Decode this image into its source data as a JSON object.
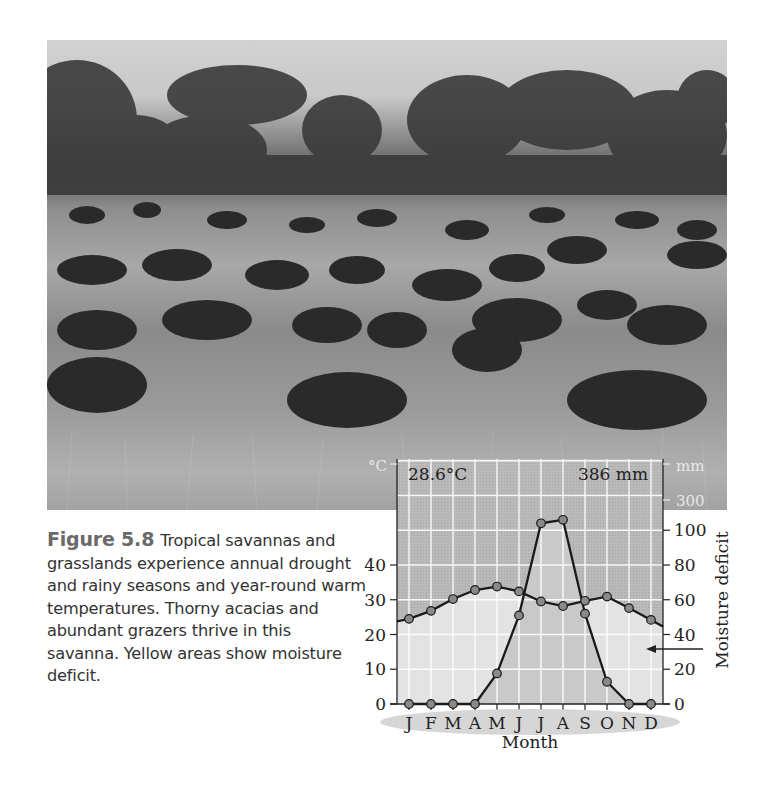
{
  "caption": {
    "figure_label": "Figure 5.8",
    "text": "Tropical savannas and grasslands experience annual drought and rainy seasons and year-round warm temperatures. Thorny acacias and abundant grazers thrive in this savanna. Yellow areas show moisture deficit."
  },
  "photo": {
    "description": "Grayscale photograph of wildebeest herd grazing in tall savanna grass with acacia trees in background"
  },
  "chart_data": {
    "type": "line",
    "title": "",
    "annotations": {
      "mean_temperature": "28.6°C",
      "annual_precipitation": "386 mm",
      "moisture_deficit_label": "Moisture deficit",
      "arrow": "points to moisture deficit (light) area"
    },
    "x": [
      "J",
      "F",
      "M",
      "A",
      "M",
      "J",
      "J",
      "A",
      "S",
      "O",
      "N",
      "D"
    ],
    "xlabel": "Month",
    "y_left": {
      "label": "°C",
      "ticks": [
        0,
        10,
        20,
        30,
        40
      ]
    },
    "y_right": {
      "label": "mm",
      "ticks": [
        0,
        20,
        40,
        60,
        80,
        100,
        300
      ]
    },
    "series": [
      {
        "name": "Temperature (°C)",
        "axis": "left",
        "values": [
          24.5,
          26.8,
          30.2,
          32.8,
          33.8,
          32.4,
          29.5,
          28.2,
          29.7,
          30.9,
          27.6,
          24.2
        ]
      },
      {
        "name": "Precipitation (mm)",
        "axis": "right",
        "values": [
          0,
          0,
          0,
          0,
          17.6,
          51,
          104,
          106,
          52,
          12.8,
          0,
          0
        ]
      }
    ],
    "grid": true,
    "legend": "none"
  },
  "axis_text": {
    "deg_c": "°C",
    "mm": "mm",
    "mm300": "300",
    "temp_label": "28.6°C",
    "precip_label": "386 mm",
    "month": "Month",
    "right_title": "Moisture deficit",
    "months": [
      "J",
      "F",
      "M",
      "A",
      "M",
      "J",
      "J",
      "A",
      "S",
      "O",
      "N",
      "D"
    ],
    "left_ticks": [
      "0",
      "10",
      "20",
      "30",
      "40"
    ],
    "right_ticks": [
      "0",
      "20",
      "40",
      "60",
      "80",
      "100"
    ]
  }
}
